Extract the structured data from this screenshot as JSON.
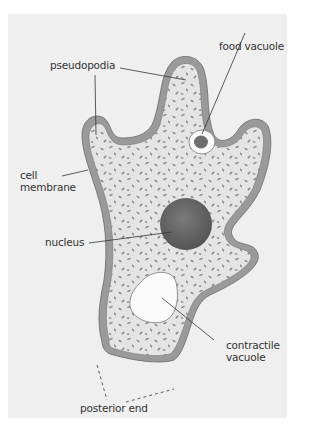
{
  "diagram": {
    "labels": {
      "pseudopodia": "pseudopodia",
      "food_vacuole": "food vacuole",
      "cell_membrane_line1": "cell",
      "cell_membrane_line2": "membrane",
      "nucleus": "nucleus",
      "contractile_vacuole_line1": "contractile",
      "contractile_vacuole_line2": "vacuole",
      "posterior_end": "posterior end"
    },
    "colors": {
      "background": "#efefef",
      "membrane": "#9a9a9a",
      "cytoplasm": "#e4e4e4",
      "granules": "#8a8a8a",
      "nucleus": "#6a6a6a",
      "food_vacuole_core": "#6e6e6e",
      "contractile_vacuole": "#fafafa",
      "label_text": "#333333"
    }
  }
}
